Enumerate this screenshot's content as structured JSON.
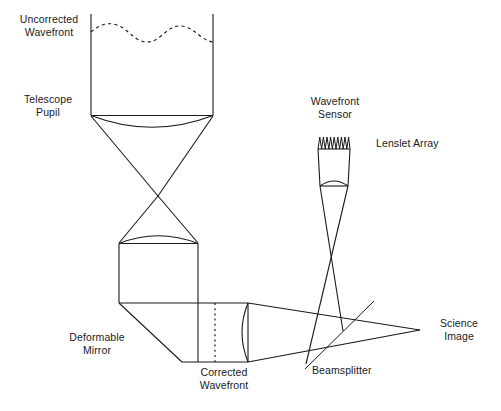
{
  "figure": {
    "background_color": "#ffffff",
    "line_color": "#1a1a1a",
    "text_color": "#1a1a1a",
    "width": 501,
    "height": 411
  },
  "labels": {
    "uncorrected_wavefront": "Uncorrected\nWavefront",
    "telescope_pupil": "Telescope\nPupil",
    "wavefront_sensor": "Wavefront\nSensor",
    "lenslet_array": "Lenslet Array",
    "deformable_mirror": "Deformable\nMirror",
    "corrected_wavefront": "Corrected\nWavefront",
    "beamsplitter": "Beamsplitter",
    "science_image": "Science\nImage"
  },
  "components": [
    {
      "name": "uncorrected-wavefront",
      "type": "dashed-wavy-line",
      "description": "Aberrated wavefront entering telescope"
    },
    {
      "name": "telescope-pupil",
      "type": "aperture-with-lens",
      "description": "Telescope entrance pupil and objective lens"
    },
    {
      "name": "focus-point",
      "type": "beam-crossing",
      "description": "Intermediate telescope focus"
    },
    {
      "name": "collimating-lens",
      "type": "lens",
      "description": "Collimator before deformable mirror"
    },
    {
      "name": "deformable-mirror",
      "type": "fold-mirror",
      "description": "Tilted mirror that corrects the wavefront"
    },
    {
      "name": "corrected-wavefront",
      "type": "dotted-vertical-line",
      "description": "Flat corrected wavefront plane"
    },
    {
      "name": "imaging-lens",
      "type": "lens",
      "description": "Lens focusing beam to science image"
    },
    {
      "name": "beamsplitter",
      "type": "diagonal-line",
      "description": "Splits light to wavefront sensor and science camera"
    },
    {
      "name": "wavefront-sensor",
      "type": "sensor-column",
      "description": "Shack-Hartmann wavefront sensor"
    },
    {
      "name": "lenslet-array",
      "type": "sawtooth-array",
      "description": "Array of small lenslets, 9 teeth"
    },
    {
      "name": "science-image",
      "type": "focal-point",
      "description": "Final science focus"
    }
  ],
  "geometry": {
    "pupil_left_x": 91,
    "pupil_right_x": 213,
    "wavefront_top_y": 14,
    "pupil_y": 115,
    "focus_y": 196,
    "lenslet_teeth": 9
  }
}
